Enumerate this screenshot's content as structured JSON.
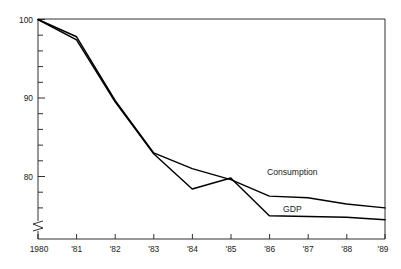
{
  "chart_data": {
    "type": "line",
    "title": "",
    "subtitle": "",
    "xlabel": "",
    "ylabel": "",
    "x": [
      "1980",
      "1981",
      "1982",
      "1983",
      "1984",
      "1985",
      "1986",
      "1987",
      "1988",
      "1989"
    ],
    "categories": [
      "1980",
      "'81",
      "'82",
      "'83",
      "'84",
      "'85",
      "'86",
      "'87",
      "'88",
      "'89"
    ],
    "x_tick_labels": [
      "1980",
      "'81",
      "'82",
      "'83",
      "'84",
      "'85",
      "'86",
      "'87",
      "'88",
      "'89"
    ],
    "y_tick_labels": [
      "100",
      "90",
      "80"
    ],
    "y_major_ticks": [
      100,
      90,
      80
    ],
    "y_minor_tick_step": 2,
    "ylim": [
      73.2,
      100.8
    ],
    "xlim": [
      1980,
      1989
    ],
    "grid": false,
    "legend_position": "inline-annotation",
    "y_axis_break": true,
    "y_axis_break_note": "zigzag break symbol on y-axis below 80",
    "series": [
      {
        "name": "Consumption",
        "label": "Consumption",
        "color": "#000000",
        "values": [
          100.0,
          97.8,
          89.7,
          83.0,
          81.0,
          79.6,
          77.5,
          77.3,
          76.5,
          76.0
        ],
        "annotation": {
          "text": "Consumption",
          "x": "1987",
          "y": 80.6
        }
      },
      {
        "name": "GDP",
        "label": "GDP",
        "color": "#000000",
        "values": [
          100.0,
          97.4,
          89.5,
          82.9,
          78.4,
          79.8,
          75.0,
          74.9,
          74.8,
          74.5
        ],
        "annotation": {
          "text": "GDP",
          "x": "1987",
          "y": 75.9
        }
      }
    ],
    "annotations": [
      {
        "text": "Consumption",
        "series": "Consumption"
      },
      {
        "text": "GDP",
        "series": "GDP"
      }
    ]
  },
  "axis": {
    "y_labels": [
      "100",
      "90",
      "80"
    ],
    "x_labels": [
      "1980",
      "'81",
      "'82",
      "'83",
      "'84",
      "'85",
      "'86",
      "'87",
      "'88",
      "'89"
    ]
  },
  "labels": {
    "consumption": "Consumption",
    "gdp": "GDP"
  },
  "colors": {
    "line": "#000000",
    "axis": "#1a1a1a",
    "background": "#ffffff",
    "text": "#1a1a1a"
  }
}
